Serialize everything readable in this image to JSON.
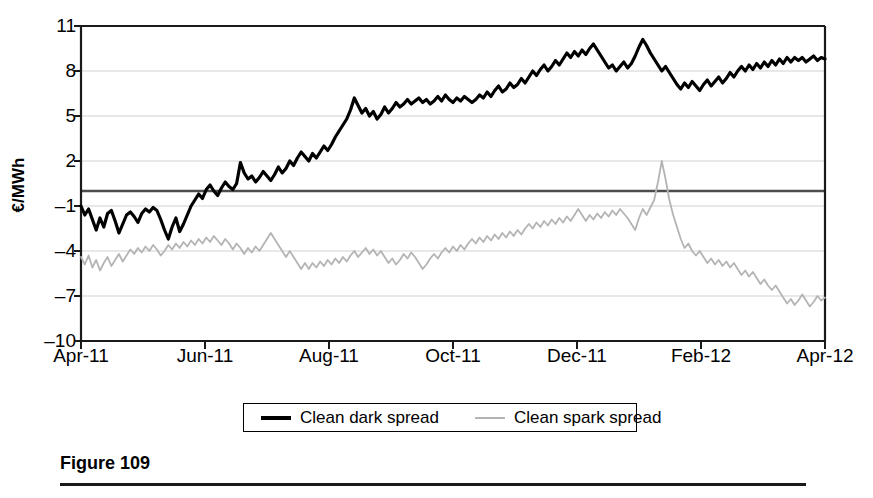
{
  "figure": {
    "caption_title": "Figure 109"
  },
  "legend": {
    "position": "bottom-center",
    "entries": [
      {
        "label": "Clean dark spread",
        "color": "#000000",
        "width": 4
      },
      {
        "label": "Clean spark spread",
        "color": "#b4b4b4",
        "width": 2
      }
    ]
  },
  "axes": {
    "ylabel": "€/MWh",
    "yticks": [
      11,
      8,
      5,
      2,
      -1,
      -4,
      -7,
      -10
    ],
    "xticks": [
      "Apr-11",
      "Jun-11",
      "Aug-11",
      "Oct-11",
      "Dec-11",
      "Feb-12",
      "Apr-12"
    ],
    "gridline_color": "#d2d2d2",
    "zero_line_color": "#4d4d4d",
    "frame_color": "#1a1a1a"
  },
  "chart_data": {
    "type": "line",
    "title": "",
    "xlabel": "",
    "ylabel": "€/MWh",
    "ylim": [
      -10,
      11
    ],
    "xlim": [
      "Apr-11",
      "Apr-12"
    ],
    "grid": true,
    "legend_position": "bottom-center",
    "xticks": [
      "Apr-11",
      "Jun-11",
      "Aug-11",
      "Oct-11",
      "Dec-11",
      "Feb-12",
      "Apr-12"
    ],
    "yticks": [
      11,
      8,
      5,
      2,
      -1,
      -4,
      -7,
      -10
    ],
    "x_fraction_note": "x values are fractions of the Apr-11..Apr-12 span (0 = Apr-11, 1 = Apr-12)",
    "series": [
      {
        "name": "Clean dark spread",
        "color": "#000000",
        "values": [
          -1.0,
          -1.6,
          -1.2,
          -1.9,
          -2.6,
          -1.8,
          -2.4,
          -1.5,
          -1.3,
          -2.0,
          -2.8,
          -2.2,
          -1.6,
          -1.4,
          -1.7,
          -2.1,
          -1.5,
          -1.2,
          -1.4,
          -1.1,
          -1.3,
          -1.9,
          -2.6,
          -3.2,
          -2.4,
          -1.8,
          -2.7,
          -2.2,
          -1.6,
          -1.0,
          -0.6,
          -0.2,
          -0.5,
          0.1,
          0.4,
          0.0,
          -0.3,
          0.2,
          0.6,
          0.3,
          0.1,
          0.5,
          1.9,
          1.2,
          0.8,
          1.0,
          0.6,
          0.9,
          1.3,
          1.0,
          0.7,
          1.1,
          1.6,
          1.2,
          1.5,
          2.0,
          1.7,
          2.2,
          2.6,
          2.3,
          2.0,
          2.5,
          2.2,
          2.6,
          3.0,
          2.7,
          3.1,
          3.6,
          4.0,
          4.4,
          4.8,
          5.4,
          6.2,
          5.7,
          5.2,
          5.5,
          5.0,
          5.3,
          4.8,
          5.1,
          5.6,
          5.2,
          5.5,
          5.9,
          5.6,
          5.8,
          6.1,
          5.8,
          6.0,
          6.2,
          5.9,
          6.1,
          5.8,
          6.0,
          6.3,
          6.0,
          6.4,
          6.1,
          5.9,
          6.2,
          6.0,
          6.3,
          6.1,
          5.9,
          6.1,
          6.4,
          6.2,
          6.6,
          6.3,
          6.7,
          7.0,
          6.6,
          6.8,
          7.2,
          6.9,
          7.1,
          7.5,
          7.2,
          7.6,
          8.0,
          7.7,
          8.1,
          8.4,
          8.0,
          8.3,
          8.7,
          8.4,
          8.8,
          9.2,
          8.9,
          9.3,
          9.0,
          9.4,
          9.1,
          9.5,
          9.8,
          9.4,
          9.0,
          8.6,
          8.2,
          8.4,
          8.0,
          8.3,
          8.6,
          8.2,
          8.5,
          9.0,
          9.6,
          10.1,
          9.7,
          9.2,
          8.8,
          8.4,
          8.0,
          8.3,
          7.9,
          7.5,
          7.1,
          6.8,
          7.2,
          6.9,
          7.3,
          7.0,
          6.7,
          7.1,
          7.4,
          7.0,
          7.3,
          7.6,
          7.2,
          7.5,
          7.9,
          7.6,
          8.0,
          8.3,
          8.0,
          8.4,
          8.1,
          8.5,
          8.2,
          8.6,
          8.3,
          8.7,
          8.4,
          8.8,
          8.5,
          8.9,
          8.6,
          8.9,
          8.7,
          8.9,
          8.6,
          8.8,
          9.0,
          8.7,
          8.9,
          8.8
        ]
      },
      {
        "name": "Clean spark spread",
        "color": "#b4b4b4",
        "values": [
          -4.4,
          -4.9,
          -4.3,
          -5.1,
          -4.6,
          -5.3,
          -4.8,
          -4.4,
          -5.0,
          -4.6,
          -4.2,
          -4.7,
          -4.3,
          -3.9,
          -4.2,
          -3.8,
          -4.1,
          -3.7,
          -4.0,
          -3.6,
          -3.9,
          -4.3,
          -4.0,
          -3.6,
          -3.9,
          -3.5,
          -3.8,
          -3.4,
          -3.7,
          -3.3,
          -3.6,
          -3.2,
          -3.5,
          -3.1,
          -3.4,
          -3.0,
          -3.3,
          -3.6,
          -3.2,
          -3.5,
          -3.9,
          -3.5,
          -3.8,
          -4.2,
          -3.8,
          -4.1,
          -3.7,
          -4.0,
          -3.6,
          -3.2,
          -2.8,
          -3.2,
          -3.6,
          -4.0,
          -4.4,
          -4.0,
          -4.4,
          -4.8,
          -5.2,
          -4.8,
          -5.2,
          -4.8,
          -5.1,
          -4.7,
          -5.0,
          -4.6,
          -4.9,
          -4.5,
          -4.8,
          -4.4,
          -4.7,
          -4.3,
          -4.0,
          -4.4,
          -4.1,
          -3.8,
          -4.2,
          -3.9,
          -4.3,
          -4.0,
          -4.4,
          -4.8,
          -4.5,
          -4.9,
          -4.6,
          -4.2,
          -4.5,
          -4.1,
          -4.4,
          -4.8,
          -5.2,
          -4.9,
          -4.5,
          -4.2,
          -4.5,
          -4.1,
          -3.8,
          -4.1,
          -3.7,
          -4.0,
          -3.6,
          -3.9,
          -3.5,
          -3.2,
          -3.5,
          -3.1,
          -3.4,
          -3.0,
          -3.3,
          -2.9,
          -3.2,
          -2.8,
          -3.1,
          -2.7,
          -3.0,
          -2.6,
          -2.9,
          -2.5,
          -2.2,
          -2.5,
          -2.1,
          -2.4,
          -2.0,
          -2.3,
          -1.9,
          -2.2,
          -1.8,
          -2.1,
          -1.7,
          -2.0,
          -1.6,
          -1.2,
          -1.6,
          -2.0,
          -1.6,
          -1.9,
          -1.5,
          -1.8,
          -1.4,
          -1.7,
          -1.3,
          -1.6,
          -1.2,
          -1.5,
          -1.8,
          -2.2,
          -2.6,
          -1.8,
          -1.2,
          -1.6,
          -1.1,
          -0.6,
          0.6,
          2.0,
          0.8,
          -0.6,
          -1.6,
          -2.4,
          -3.2,
          -3.8,
          -3.5,
          -4.0,
          -4.3,
          -4.0,
          -4.4,
          -4.8,
          -4.5,
          -4.9,
          -4.6,
          -5.0,
          -4.7,
          -5.1,
          -4.8,
          -5.2,
          -5.6,
          -5.3,
          -5.7,
          -5.4,
          -5.8,
          -6.2,
          -5.9,
          -6.3,
          -6.6,
          -6.3,
          -6.7,
          -7.1,
          -7.5,
          -7.2,
          -7.6,
          -7.3,
          -6.9,
          -7.3,
          -7.7,
          -7.4,
          -7.0,
          -7.3,
          -7.1
        ]
      }
    ]
  }
}
